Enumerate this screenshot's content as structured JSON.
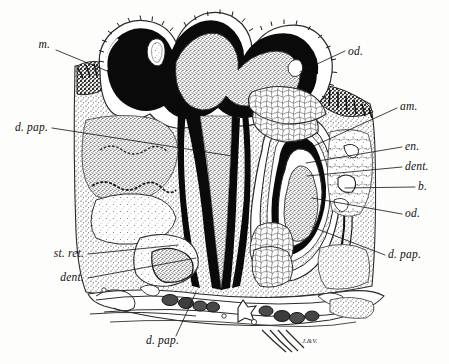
{
  "figure": {
    "kind": "histological-illustration",
    "signature": "J.&V.",
    "palette": {
      "paper": "#fdfdfb",
      "ink": "#111111",
      "dentine_black": "#0a0a0a",
      "enamel_white": "#ffffff",
      "pulp_stipple": "#cfcfcf",
      "tissue_stipple": "#d8d8d6",
      "vessel_dark": "#4a4a4a",
      "reticulum_light": "#f2f2f0"
    }
  },
  "labels": [
    {
      "id": "m",
      "text": "m.",
      "x": 50,
      "y": 48,
      "anchor": "end",
      "leader": [
        [
          56,
          50
        ],
        [
          112,
          73
        ]
      ]
    },
    {
      "id": "od-top",
      "text": "od.",
      "x": 348,
      "y": 55,
      "anchor": "start",
      "leader": [
        [
          345,
          51
        ],
        [
          300,
          72
        ]
      ]
    },
    {
      "id": "am",
      "text": "am.",
      "x": 400,
      "y": 110,
      "anchor": "start",
      "leader": [
        [
          397,
          108
        ],
        [
          305,
          150
        ]
      ]
    },
    {
      "id": "d-pap-left",
      "text": "d. pap.",
      "x": 48,
      "y": 131,
      "anchor": "end",
      "leader": [
        [
          52,
          128
        ],
        [
          232,
          156
        ]
      ]
    },
    {
      "id": "en",
      "text": "en.",
      "x": 405,
      "y": 150,
      "anchor": "start",
      "leader": [
        [
          402,
          147
        ],
        [
          306,
          163
        ]
      ]
    },
    {
      "id": "dent-right",
      "text": "dent.",
      "x": 405,
      "y": 170,
      "anchor": "start",
      "leader": [
        [
          402,
          167
        ],
        [
          307,
          176
        ]
      ]
    },
    {
      "id": "b",
      "text": "b.",
      "x": 418,
      "y": 190,
      "anchor": "start",
      "leader": [
        [
          415,
          187
        ],
        [
          345,
          188
        ]
      ]
    },
    {
      "id": "od-right",
      "text": "od.",
      "x": 405,
      "y": 217,
      "anchor": "start",
      "leader": [
        [
          402,
          214
        ],
        [
          312,
          198
        ]
      ]
    },
    {
      "id": "d-pap-right",
      "text": "d. pap.",
      "x": 388,
      "y": 258,
      "anchor": "start",
      "leader": [
        [
          385,
          255
        ],
        [
          312,
          227
        ]
      ]
    },
    {
      "id": "st-ret",
      "text": "st. ret.",
      "x": 84,
      "y": 257,
      "anchor": "end",
      "leader": [
        [
          88,
          254
        ],
        [
          178,
          245
        ]
      ]
    },
    {
      "id": "dent-left",
      "text": "dent.",
      "x": 84,
      "y": 281,
      "anchor": "end",
      "leader": [
        [
          88,
          278
        ],
        [
          196,
          258
        ]
      ]
    },
    {
      "id": "d-pap-bot",
      "text": "d. pap.",
      "x": 146,
      "y": 344,
      "anchor": "start",
      "leader": [
        [
          176,
          336
        ],
        [
          196,
          292
        ]
      ]
    }
  ],
  "structures": [
    {
      "id": "oral-epithelium",
      "name": "oral epithelium (m.)"
    },
    {
      "id": "enamel-layer",
      "name": "enamel (en.)"
    },
    {
      "id": "dentine-layer",
      "name": "dentine (dent.)"
    },
    {
      "id": "odontoblast-layer",
      "name": "odontoblasts (od.)"
    },
    {
      "id": "ameloblast-layer",
      "name": "ameloblasts (am.)"
    },
    {
      "id": "dental-papilla",
      "name": "dental papilla (d. pap.)"
    },
    {
      "id": "stellate-reticulum",
      "name": "stellate reticulum (st. ret.)"
    },
    {
      "id": "bone",
      "name": "bone (b.)"
    }
  ]
}
